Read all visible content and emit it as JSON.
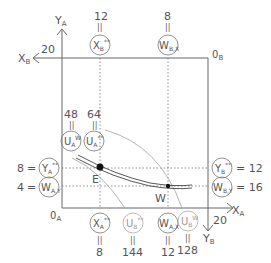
{
  "axes": {
    "origin_a": "0A",
    "origin_b": "0B",
    "x_a": "XA",
    "y_a": "YA",
    "x_b": "XB",
    "y_b": "YB",
    "x_a_max": "20",
    "x_b_max": "20"
  },
  "points": {
    "e": "E",
    "w": "W"
  },
  "top_labels": [
    {
      "value": "12",
      "symbol": "X",
      "sub": "B",
      "sup": "**"
    },
    {
      "value": "8",
      "symbol": "W",
      "sub": "B,X",
      "sup": ""
    }
  ],
  "left_top_labels": [
    {
      "value": "48",
      "symbol": "U",
      "sub": "A",
      "sup": "W"
    },
    {
      "value": "64",
      "symbol": "U",
      "sub": "A",
      "sup": "**"
    }
  ],
  "left_labels": [
    {
      "value": "8",
      "symbol": "Y",
      "sub": "A",
      "sup": "**"
    },
    {
      "value": "4",
      "symbol": "W",
      "sub": "A,Y",
      "sup": ""
    }
  ],
  "right_labels": [
    {
      "value": "12",
      "symbol": "Y",
      "sub": "B",
      "sup": "**"
    },
    {
      "value": "16",
      "symbol": "W",
      "sub": "B,Y",
      "sup": ""
    }
  ],
  "bottom_labels": [
    {
      "value": "8",
      "symbol": "X",
      "sub": "A",
      "sup": "**"
    },
    {
      "value": "144",
      "symbol": "U",
      "sub": "B",
      "sup": "**"
    },
    {
      "value": "12",
      "symbol": "W",
      "sub": "A,X",
      "sup": ""
    },
    {
      "value": "128",
      "symbol": "U",
      "sub": "B",
      "sup": "W"
    }
  ],
  "equals": "=",
  "equals_vertical": "="
}
